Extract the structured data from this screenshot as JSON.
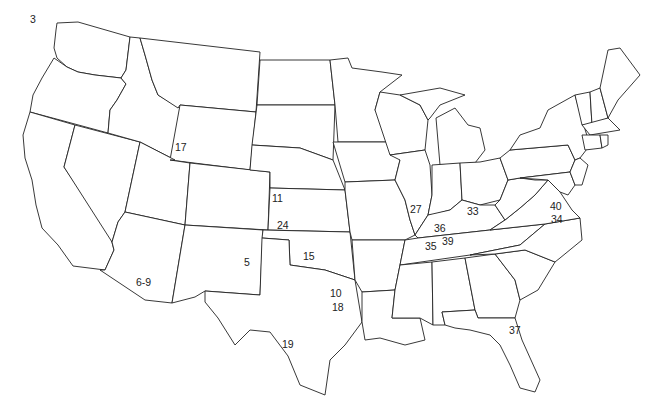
{
  "map": {
    "title": "",
    "region": "Contiguous United States",
    "line_color": "#222222",
    "background": "#ffffff",
    "labels": [
      {
        "text": "3",
        "x": 30,
        "y": 42,
        "area": "Washington"
      },
      {
        "text": "17",
        "x": 175,
        "y": 142,
        "area": "Idaho/Wyoming border"
      },
      {
        "text": "11",
        "x": 272,
        "y": 193,
        "area": "Kansas (northwest)"
      },
      {
        "text": "24",
        "x": 277,
        "y": 220,
        "area": "Kansas (southwest)"
      },
      {
        "text": "5",
        "x": 244,
        "y": 257,
        "area": "New Mexico (east)"
      },
      {
        "text": "15",
        "x": 303,
        "y": 251,
        "area": "Oklahoma"
      },
      {
        "text": "6-9",
        "x": 136,
        "y": 277,
        "area": "Arizona"
      },
      {
        "text": "10",
        "x": 330,
        "y": 288,
        "area": "Texas (northeast)"
      },
      {
        "text": "18",
        "x": 332,
        "y": 302,
        "area": "Texas (northeast)"
      },
      {
        "text": "19",
        "x": 282,
        "y": 339,
        "area": "Texas (central)"
      },
      {
        "text": "27",
        "x": 410,
        "y": 204,
        "area": "Illinois (south)"
      },
      {
        "text": "33",
        "x": 467,
        "y": 206,
        "area": "Kentucky"
      },
      {
        "text": "36",
        "x": 434,
        "y": 223,
        "area": "Kentucky (west)"
      },
      {
        "text": "35",
        "x": 425,
        "y": 241,
        "area": "Tennessee (west)"
      },
      {
        "text": "39",
        "x": 442,
        "y": 236,
        "area": "Tennessee"
      },
      {
        "text": "40",
        "x": 550,
        "y": 201,
        "area": "Virginia"
      },
      {
        "text": "34",
        "x": 551,
        "y": 214,
        "area": "Virginia/North Carolina border"
      },
      {
        "text": "37",
        "x": 509,
        "y": 325,
        "area": "Florida (north)"
      }
    ]
  }
}
